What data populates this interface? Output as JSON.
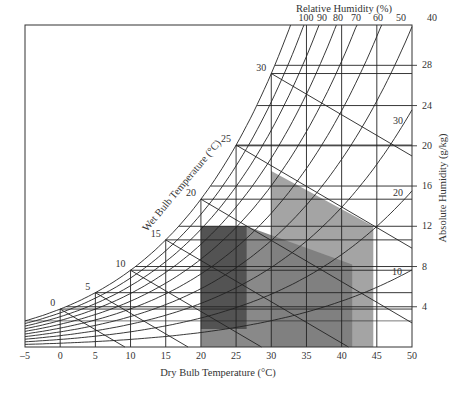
{
  "chart_data": {
    "type": "psychrometric",
    "title": "",
    "xlabel": "Dry Bulb Temperature (°C)",
    "ylabel_right": "Absolute Humidity (g/kg)",
    "top_label": "Relative Humidity (%)",
    "curve_label": "Wet Bulb Temperature (°C)",
    "xlim": [
      -5,
      50
    ],
    "ylim": [
      0,
      32
    ],
    "x_ticks": [
      -5,
      0,
      5,
      10,
      15,
      20,
      25,
      30,
      35,
      40,
      45,
      50
    ],
    "y_ticks": [
      4,
      8,
      12,
      16,
      20,
      24,
      28
    ],
    "rh_curves": [
      100,
      90,
      80,
      70,
      60,
      50,
      40,
      30,
      20,
      10
    ],
    "rh_top_labels": [
      "100",
      "90",
      "80",
      "70",
      "60",
      "50",
      "40"
    ],
    "rh_side_labels": [
      "30",
      "20",
      "10"
    ],
    "wet_bulb_labels": [
      "0",
      "5",
      "10",
      "15",
      "20",
      "25",
      "30"
    ],
    "regions": [
      {
        "name": "light-zone",
        "color": "#9a9a9a",
        "polygon_tC_gkg": [
          [
            30,
            0
          ],
          [
            30,
            17.5
          ],
          [
            44.5,
            12
          ],
          [
            44.5,
            0
          ]
        ]
      },
      {
        "name": "medium-zone",
        "color": "#7c7c7c",
        "polygon_tC_gkg": [
          [
            20,
            0
          ],
          [
            20,
            12
          ],
          [
            26.5,
            12
          ],
          [
            41.5,
            8.2
          ],
          [
            41.5,
            0
          ]
        ]
      },
      {
        "name": "dark-zone",
        "color": "#4a4a4a",
        "polygon_tC_gkg": [
          [
            20,
            1.8
          ],
          [
            20,
            12
          ],
          [
            26.5,
            12
          ],
          [
            26.5,
            1.8
          ]
        ]
      }
    ]
  },
  "labels": {
    "x_axis_title": "Dry Bulb Temperature (°C)",
    "y_axis_title": "Absolute Humidity (g/kg)",
    "top_title": "Relative Humidity (%)",
    "wet_bulb_title": "Wet Bulb Temperature (°C)"
  }
}
